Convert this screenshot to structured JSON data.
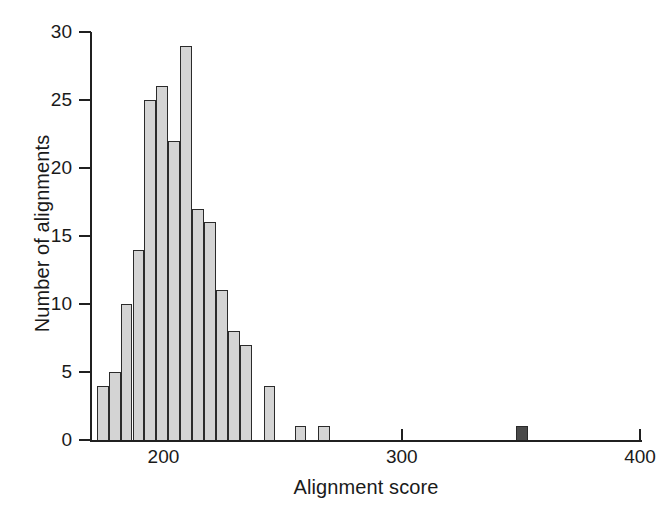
{
  "figure": {
    "background_color": "#ffffff",
    "axis_color": "#202020",
    "bar_fill_color": "#d4d4d4",
    "bar_edge_color": "#2b2b2b",
    "highlight_fill_color": "#4a4a4a"
  },
  "chart_data": {
    "type": "bar",
    "title": "",
    "subtitle": "",
    "xlabel": "Alignment score",
    "ylabel": "Number of alignments",
    "xlim": [
      170,
      400
    ],
    "ylim": [
      0,
      30
    ],
    "xticks": [
      200,
      300,
      400
    ],
    "xtick_labels": [
      "200",
      "300",
      "400"
    ],
    "yticks": [
      0,
      5,
      10,
      15,
      20,
      25,
      30
    ],
    "ytick_labels": [
      "0",
      "5",
      "10",
      "15",
      "20",
      "25",
      "30"
    ],
    "grid": false,
    "legend": null,
    "bin_width": 5,
    "annotations": [
      "Dark filled bar at approximately score 350 marks the true/query alignment score"
    ],
    "bars": [
      {
        "bin_start": 172,
        "bin_end": 177,
        "x_center": 174.5,
        "value": 4,
        "highlight": false
      },
      {
        "bin_start": 177,
        "bin_end": 182,
        "x_center": 179.5,
        "value": 5,
        "highlight": false
      },
      {
        "bin_start": 182,
        "bin_end": 187,
        "x_center": 184.5,
        "value": 10,
        "highlight": false
      },
      {
        "bin_start": 187,
        "bin_end": 192,
        "x_center": 189.5,
        "value": 14,
        "highlight": false
      },
      {
        "bin_start": 192,
        "bin_end": 197,
        "x_center": 194.5,
        "value": 25,
        "highlight": false
      },
      {
        "bin_start": 197,
        "bin_end": 202,
        "x_center": 199.5,
        "value": 26,
        "highlight": false
      },
      {
        "bin_start": 202,
        "bin_end": 207,
        "x_center": 204.5,
        "value": 22,
        "highlight": false
      },
      {
        "bin_start": 207,
        "bin_end": 212,
        "x_center": 209.5,
        "value": 29,
        "highlight": false
      },
      {
        "bin_start": 212,
        "bin_end": 217,
        "x_center": 214.5,
        "value": 17,
        "highlight": false
      },
      {
        "bin_start": 217,
        "bin_end": 222,
        "x_center": 219.5,
        "value": 16,
        "highlight": false
      },
      {
        "bin_start": 222,
        "bin_end": 227,
        "x_center": 224.5,
        "value": 11,
        "highlight": false
      },
      {
        "bin_start": 227,
        "bin_end": 232,
        "x_center": 229.5,
        "value": 8,
        "highlight": false
      },
      {
        "bin_start": 232,
        "bin_end": 237,
        "x_center": 234.5,
        "value": 7,
        "highlight": false
      },
      {
        "bin_start": 237,
        "bin_end": 242,
        "x_center": 239.5,
        "value": 0,
        "highlight": false
      },
      {
        "bin_start": 242,
        "bin_end": 247,
        "x_center": 244.5,
        "value": 4,
        "highlight": false
      },
      {
        "bin_start": 255,
        "bin_end": 260,
        "x_center": 257.5,
        "value": 1,
        "highlight": false
      },
      {
        "bin_start": 265,
        "bin_end": 270,
        "x_center": 267.5,
        "value": 1,
        "highlight": false
      },
      {
        "bin_start": 348,
        "bin_end": 353,
        "x_center": 350.5,
        "value": 1,
        "highlight": true
      }
    ]
  }
}
